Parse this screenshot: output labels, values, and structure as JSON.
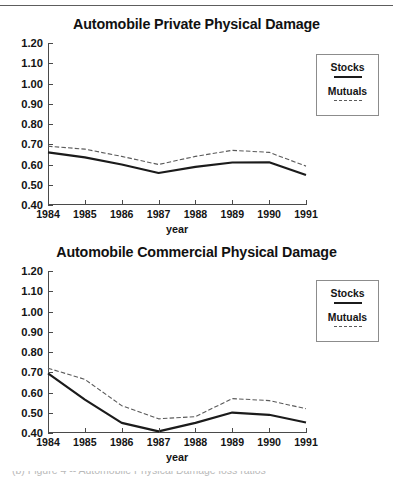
{
  "page": {
    "background_color": "#ffffff",
    "rule_color": "#5d5d5d",
    "caption_partial": "(b)  Figure 4 -- Automobile Physical Damage loss ratios"
  },
  "legend": {
    "stocks_label": "Stocks",
    "mutuals_label": "Mutuals",
    "stocks_key": "solid-line-swatch",
    "mutuals_key": "dashed-line-swatch"
  },
  "axis": {
    "x_title": "year",
    "y_ticks": [
      "0.40",
      "0.50",
      "0.60",
      "0.70",
      "0.80",
      "0.90",
      "1.00",
      "1.10",
      "1.20"
    ],
    "x_ticks": [
      "1984",
      "1985",
      "1986",
      "1987",
      "1988",
      "1989",
      "1990",
      "1991"
    ]
  },
  "chart_data": [
    {
      "type": "line",
      "title": "Automobile Private Physical Damage",
      "xlabel": "year",
      "ylabel": "",
      "categories": [
        "1984",
        "1985",
        "1986",
        "1987",
        "1988",
        "1989",
        "1990",
        "1991"
      ],
      "x": [
        1984,
        1985,
        1986,
        1987,
        1988,
        1989,
        1990,
        1991
      ],
      "ylim": [
        0.4,
        1.2
      ],
      "ytick_step": 0.1,
      "xlim": [
        1984,
        1991
      ],
      "grid": false,
      "legend_position": "right-outside-top",
      "series": [
        {
          "name": "Stocks",
          "style": "solid",
          "color": "#1b1b1b",
          "width": 2.2,
          "values": [
            0.66,
            0.635,
            0.6,
            0.558,
            0.588,
            0.61,
            0.611,
            0.548
          ]
        },
        {
          "name": "Mutuals",
          "style": "dashed",
          "color": "#5a5a5a",
          "width": 1.1,
          "values": [
            0.69,
            0.676,
            0.64,
            0.6,
            0.64,
            0.67,
            0.66,
            0.592
          ]
        }
      ]
    },
    {
      "type": "line",
      "title": "Automobile Commercial Physical Damage",
      "xlabel": "year",
      "ylabel": "",
      "categories": [
        "1984",
        "1985",
        "1986",
        "1987",
        "1988",
        "1989",
        "1990",
        "1991"
      ],
      "x": [
        1984,
        1985,
        1986,
        1987,
        1988,
        1989,
        1990,
        1991
      ],
      "ylim": [
        0.4,
        1.2
      ],
      "ytick_step": 0.1,
      "xlim": [
        1984,
        1991
      ],
      "grid": false,
      "legend_position": "right-outside-top",
      "series": [
        {
          "name": "Stocks",
          "style": "solid",
          "color": "#1b1b1b",
          "width": 2.2,
          "values": [
            0.694,
            0.565,
            0.45,
            0.408,
            0.45,
            0.501,
            0.49,
            0.452
          ]
        },
        {
          "name": "Mutuals",
          "style": "dashed",
          "color": "#5a5a5a",
          "width": 1.1,
          "values": [
            0.72,
            0.665,
            0.535,
            0.47,
            0.481,
            0.57,
            0.56,
            0.52
          ]
        }
      ]
    }
  ]
}
